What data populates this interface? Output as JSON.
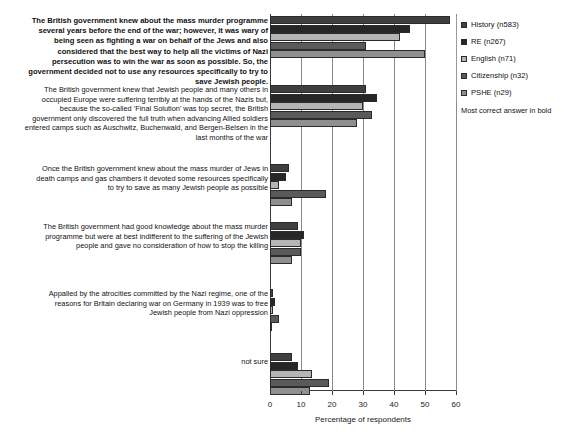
{
  "chart_data": {
    "type": "bar",
    "orientation": "horizontal",
    "title": "",
    "xlabel": "Percentage of respondents",
    "ylabel": "",
    "xlim": [
      0,
      60
    ],
    "xticks": [
      0,
      10,
      20,
      30,
      40,
      50,
      60
    ],
    "grid": true,
    "legend_position": "right",
    "legend_note": "Most correct answer in bold",
    "categories": [
      "The British government knew about the mass murder programme several years before the end of the war; however, it was wary of being seen as fighting a war on behalf of the Jews and also considered that the best way to help all the victims of Nazi persecution was to win the war as soon as possible. So, the government decided not to use any resources specifically to try to save Jewish people.",
      "The British government knew that Jewish people and many others in occupied Europe were suffering terribly at the hands of the Nazis but, because the so-called 'Final Solution' was top secret, the British government only discovered the full truth when advancing Allied soldiers entered camps such as Auschwitz, Buchenwald, and Bergen-Belsen in the last months of the war",
      "Once the British government knew about the mass murder of Jews in death camps and gas chambers it devoted some resources specifically to try to save as many Jewish people as possible",
      "The British government had good knowledge about the mass murder programme but were at best indifferent to the suffering of the Jewish people and gave no consideration of how to stop the killing",
      "Appalled by the atrocities committed by the Nazi regime, one of the reasons for Britain declaring war on Germany in 1939 was to free Jewish people from Nazi oppression",
      "not sure"
    ],
    "categories_bold": [
      true,
      false,
      false,
      false,
      false,
      false
    ],
    "series": [
      {
        "name": "History (n583)",
        "color": "#3f3f3f",
        "values": [
          58.0,
          31.0,
          6.0,
          9.0,
          1.0,
          7.0
        ]
      },
      {
        "name": "RE (n267)",
        "color": "#262626",
        "values": [
          45.0,
          34.5,
          5.0,
          11.0,
          1.5,
          9.0
        ]
      },
      {
        "name": "English (n71)",
        "color": "#b5b5b5",
        "values": [
          42.0,
          30.0,
          3.0,
          10.0,
          1.0,
          13.5
        ]
      },
      {
        "name": "Citizenship (n32)",
        "color": "#5a5a5a",
        "values": [
          31.0,
          33.0,
          18.0,
          10.0,
          3.0,
          19.0
        ]
      },
      {
        "name": "PSHE (n29)",
        "color": "#8f8f8f",
        "values": [
          50.0,
          28.0,
          7.0,
          7.0,
          0.5,
          13.0
        ]
      }
    ]
  },
  "legend": {
    "items": [
      {
        "label": "History (n583)"
      },
      {
        "label": "RE (n267)"
      },
      {
        "label": "English (n71)"
      },
      {
        "label": "Citizenship (n32)"
      },
      {
        "label": "PSHE (n29)"
      }
    ],
    "note": "Most correct answer in bold"
  },
  "axis": {
    "x_title": "Percentage of respondents",
    "x_tick_labels": [
      "0",
      "10",
      "20",
      "30",
      "40",
      "50",
      "60"
    ]
  }
}
